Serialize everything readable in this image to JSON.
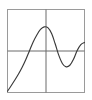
{
  "figure": {
    "title": "",
    "background_color": "#ffffff",
    "frame_color": "#9a9a9a",
    "axis_color": "#6b6b6b",
    "curve_color": "#3a3a3a",
    "frame": {
      "x": 7,
      "y": 9,
      "width": 78,
      "height": 84
    }
  },
  "chart_data": {
    "type": "line",
    "title": "",
    "xlabel": "",
    "ylabel": "",
    "xlim": [
      -2.1,
      2.1
    ],
    "ylim": [
      -1.6,
      1.6
    ],
    "grid": false,
    "legend": null,
    "axes": {
      "x_axis_at_y": 0,
      "y_axis_at_x": 0,
      "show_ticks": false,
      "show_tick_labels": false,
      "show_spines": true
    },
    "annotations": [
      {
        "label": "local maximum",
        "x": -0.05,
        "y": 0.93
      },
      {
        "label": "local minimum",
        "x": 1.12,
        "y": -0.61
      },
      {
        "label": "x-intercept",
        "x": -1.03,
        "y": 0
      },
      {
        "label": "x-intercept",
        "x": 0.52,
        "y": 0
      }
    ],
    "series": [
      {
        "name": "curve",
        "color": "#3a3a3a",
        "x": [
          -2.1,
          -1.9,
          -1.7,
          -1.5,
          -1.3,
          -1.1,
          -0.9,
          -0.7,
          -0.5,
          -0.3,
          -0.1,
          0.1,
          0.3,
          0.5,
          0.7,
          0.9,
          1.1,
          1.3,
          1.5,
          1.7,
          1.9,
          2.1
        ],
        "y": [
          -1.55,
          -1.34,
          -1.12,
          -0.89,
          -0.63,
          -0.33,
          0.01,
          0.35,
          0.62,
          0.83,
          0.93,
          0.9,
          0.68,
          0.28,
          -0.17,
          -0.49,
          -0.61,
          -0.55,
          -0.32,
          0.02,
          0.25,
          0.33
        ]
      }
    ]
  }
}
